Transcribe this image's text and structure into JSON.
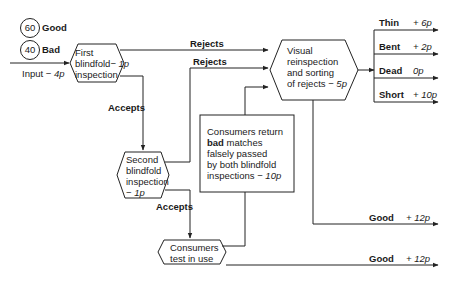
{
  "legend": {
    "good_count": "60",
    "good_label": "Good",
    "bad_count": "40",
    "bad_label": "Bad"
  },
  "input": {
    "label": "Input",
    "cost": "− 4p"
  },
  "nodes": {
    "first": {
      "line1": "First",
      "line2": "blindfold",
      "cost": "− 1p",
      "line3": "inspection"
    },
    "second": {
      "line1": "Second",
      "line2": "blindfold",
      "line3": "inspection",
      "cost": "− 1p"
    },
    "visual": {
      "line1": "Visual",
      "line2": "reinspection",
      "line3": "and sorting",
      "line4": "of rejects",
      "cost": "− 5p"
    },
    "consumers_test": {
      "line1": "Consumers",
      "line2": "test in use"
    },
    "consumers_return": {
      "line1": "Consumers return",
      "bold": "bad",
      "line2rest": " matches",
      "line3": "falsely passed",
      "line4": "by both blindfold",
      "line5": "inspections",
      "cost": "− 10p"
    }
  },
  "edges": {
    "rejects1": "Rejects",
    "rejects2": "Rejects",
    "accepts1": "Accepts",
    "accepts2": "Accepts"
  },
  "outputs": {
    "sorted": [
      {
        "label": "Thin",
        "value": "+ 6p"
      },
      {
        "label": "Bent",
        "value": "+ 2p"
      },
      {
        "label": "Dead",
        "value": "0p"
      },
      {
        "label": "Short",
        "value": "+ 10p"
      }
    ],
    "good1": {
      "label": "Good",
      "value": "+ 12p"
    },
    "good2": {
      "label": "Good",
      "value": "+ 12p"
    }
  }
}
